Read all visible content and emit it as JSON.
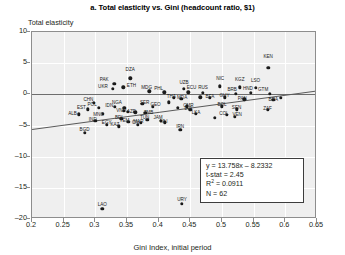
{
  "chart_data": {
    "type": "scatter",
    "title": "a. Total elasticity vs. Gini (headcount ratio, $1)",
    "xlabel": "Gini Index, initial period",
    "ylabel": "Total elasticity",
    "xlim": [
      0.2,
      0.65
    ],
    "ylim": [
      -20,
      10
    ],
    "xticks": [
      "0.2",
      "0.25",
      "0.3",
      "0.35",
      "0.4",
      "0.45",
      "0.5",
      "0.55",
      "0.6",
      "0.65"
    ],
    "xtick_values": [
      0.2,
      0.25,
      0.3,
      0.35,
      0.4,
      0.45,
      0.5,
      0.55,
      0.6,
      0.65
    ],
    "yticks": [
      "10",
      "5",
      "0",
      "–5",
      "–10",
      "–15",
      "–20"
    ],
    "ytick_values": [
      10,
      5,
      0,
      -5,
      -10,
      -15,
      -20
    ],
    "grid": true,
    "legend": "none",
    "zero_reference_line": 0,
    "trendline": {
      "slope": 13.758,
      "intercept": -8.2332,
      "x_start": 0.2,
      "x_end": 0.65
    },
    "points": [
      {
        "label": "KEN",
        "x": 0.573,
        "y": 4.3,
        "lx": 0.573,
        "ly": 6.2
      },
      {
        "label": "DZA",
        "x": 0.355,
        "y": 2.6,
        "lx": 0.355,
        "ly": 4.0
      },
      {
        "label": "PAK",
        "x": 0.33,
        "y": 1.7,
        "lx": 0.314,
        "ly": 2.5
      },
      {
        "label": "ETH",
        "x": 0.344,
        "y": 1.1,
        "lx": 0.357,
        "ly": 1.5
      },
      {
        "label": "UKR",
        "x": 0.328,
        "y": 0.9,
        "lx": 0.312,
        "ly": 1.3
      },
      {
        "label": "LSO",
        "x": 0.553,
        "y": 1.0,
        "lx": 0.553,
        "ly": 2.3
      },
      {
        "label": "KGZ",
        "x": 0.528,
        "y": 1.1,
        "lx": 0.528,
        "ly": 2.4
      },
      {
        "label": "NIC",
        "x": 0.497,
        "y": 1.3,
        "lx": 0.497,
        "ly": 2.6
      },
      {
        "label": "UZB",
        "x": 0.44,
        "y": 0.9,
        "lx": 0.44,
        "ly": 1.9
      },
      {
        "label": "GTM",
        "x": 0.575,
        "y": 0.1,
        "lx": 0.565,
        "ly": 0.9
      },
      {
        "label": "HND",
        "x": 0.545,
        "y": 0.2,
        "lx": 0.541,
        "ly": 1.0
      },
      {
        "label": "BRB",
        "x": 0.522,
        "y": 0.1,
        "lx": 0.516,
        "ly": 0.9
      },
      {
        "label": "RUS",
        "x": 0.47,
        "y": 0.2,
        "lx": 0.47,
        "ly": 1.1
      },
      {
        "label": "ECU",
        "x": 0.447,
        "y": 0.3,
        "lx": 0.452,
        "ly": 1.2
      },
      {
        "label": "PHL",
        "x": 0.409,
        "y": 0.3,
        "lx": 0.4,
        "ly": 1.0
      },
      {
        "label": "MDG",
        "x": 0.385,
        "y": 0.5,
        "lx": 0.381,
        "ly": 1.1
      },
      {
        "label": "NGA",
        "x": 0.346,
        "y": -2.2,
        "lx": 0.334,
        "ly": -1.3
      },
      {
        "label": "CHN",
        "x": 0.298,
        "y": -1.4,
        "lx": 0.289,
        "ly": -0.7
      },
      {
        "label": "POL",
        "x": 0.305,
        "y": -2.2,
        "lx": 0.295,
        "ly": -1.6
      },
      {
        "label": "IDN",
        "x": 0.331,
        "y": -2.0,
        "lx": 0.322,
        "ly": -1.7
      },
      {
        "label": "VNM",
        "x": 0.351,
        "y": -2.8,
        "lx": 0.341,
        "ly": -2.5
      },
      {
        "label": "EST",
        "x": 0.288,
        "y": -2.4,
        "lx": 0.278,
        "ly": -2.1
      },
      {
        "label": "SER",
        "x": 0.374,
        "y": -1.5,
        "lx": 0.378,
        "ly": -1.2
      },
      {
        "label": "GEO",
        "x": 0.391,
        "y": -2.0,
        "lx": 0.395,
        "ly": -1.6
      },
      {
        "label": "AZE",
        "x": 0.363,
        "y": -2.9,
        "lx": 0.357,
        "ly": -2.6
      },
      {
        "label": "ZMB",
        "x": 0.379,
        "y": -3.0,
        "lx": 0.384,
        "ly": -2.9
      },
      {
        "label": "ALB",
        "x": 0.274,
        "y": -3.2,
        "lx": 0.264,
        "ly": -3.0
      },
      {
        "label": "MNG",
        "x": 0.312,
        "y": -3.1,
        "lx": 0.305,
        "ly": -3.1
      },
      {
        "label": "THA",
        "x": 0.424,
        "y": -0.6,
        "lx": 0.42,
        "ly": -0.3
      },
      {
        "label": "MDA",
        "x": 0.436,
        "y": -0.7,
        "lx": 0.437,
        "ly": -0.4
      },
      {
        "label": "BFA",
        "x": 0.481,
        "y": -0.6,
        "lx": 0.481,
        "ly": -0.3
      },
      {
        "label": "GUY",
        "x": 0.504,
        "y": -0.5,
        "lx": 0.504,
        "ly": -0.1
      },
      {
        "label": "PAN",
        "x": 0.535,
        "y": -0.8,
        "lx": 0.532,
        "ly": -0.6
      },
      {
        "label": "BRA",
        "x": 0.581,
        "y": -0.9,
        "lx": 0.581,
        "ly": -0.7
      },
      {
        "label": "CMR",
        "x": 0.444,
        "y": -1.9,
        "lx": 0.447,
        "ly": -1.7
      },
      {
        "label": "BOL",
        "x": 0.5,
        "y": -1.9,
        "lx": 0.5,
        "ly": -1.6
      },
      {
        "label": "SEN",
        "x": 0.523,
        "y": -2.4,
        "lx": 0.523,
        "ly": -2.1
      },
      {
        "label": "ZAF",
        "x": 0.572,
        "y": -2.5,
        "lx": 0.572,
        "ly": -2.2
      },
      {
        "label": "LKA",
        "x": 0.459,
        "y": -3.1,
        "lx": 0.459,
        "ly": -2.8
      },
      {
        "label": "COL",
        "x": 0.508,
        "y": -3.3,
        "lx": 0.503,
        "ly": -3.0
      },
      {
        "label": "VEN",
        "x": 0.52,
        "y": -3.6,
        "lx": 0.524,
        "ly": -3.2
      },
      {
        "label": "LVA",
        "x": 0.45,
        "y": -2.5,
        "lx": 0.447,
        "ly": -2.2
      },
      {
        "label": "JAM",
        "x": 0.403,
        "y": -4.2,
        "lx": 0.399,
        "ly": -3.7
      },
      {
        "label": "TUN",
        "x": 0.382,
        "y": -4.1,
        "lx": 0.378,
        "ly": -3.6
      },
      {
        "label": "YEM",
        "x": 0.352,
        "y": -4.4,
        "lx": 0.346,
        "ly": -4.1
      },
      {
        "label": "MAR",
        "x": 0.372,
        "y": -4.6,
        "lx": 0.368,
        "ly": -4.3
      },
      {
        "label": "MLI",
        "x": 0.41,
        "y": -4.5,
        "lx": 0.408,
        "ly": -4.2
      },
      {
        "label": "BDI",
        "x": 0.341,
        "y": -3.9,
        "lx": 0.337,
        "ly": -3.6
      },
      {
        "label": "IND",
        "x": 0.3,
        "y": -4.2,
        "lx": 0.296,
        "ly": -3.9
      },
      {
        "label": "CIV",
        "x": 0.367,
        "y": -4.9,
        "lx": 0.364,
        "ly": -4.5
      },
      {
        "label": "EGY",
        "x": 0.318,
        "y": -4.9,
        "lx": 0.318,
        "ly": -4.4
      },
      {
        "label": "KAZ",
        "x": 0.337,
        "y": -5.1,
        "lx": 0.331,
        "ly": -4.7
      },
      {
        "label": "BGD",
        "x": 0.283,
        "y": -6.2,
        "lx": 0.283,
        "ly": -5.6
      },
      {
        "label": "IRN",
        "x": 0.434,
        "y": -5.7,
        "lx": 0.434,
        "ly": -5.1
      },
      {
        "label": "LAO",
        "x": 0.311,
        "y": -18.4,
        "lx": 0.311,
        "ly": -17.6
      },
      {
        "label": "URY",
        "x": 0.437,
        "y": -17.6,
        "lx": 0.437,
        "ly": -16.8
      },
      {
        "label": "",
        "x": 0.593,
        "y": -0.6,
        "lx": 0,
        "ly": 0
      },
      {
        "label": "",
        "x": 0.466,
        "y": -0.5,
        "lx": 0,
        "ly": 0
      },
      {
        "label": "",
        "x": 0.416,
        "y": -1.3,
        "lx": 0,
        "ly": 0
      },
      {
        "label": "",
        "x": 0.489,
        "y": -3.8,
        "lx": 0,
        "ly": 0
      },
      {
        "label": "",
        "x": 0.345,
        "y": -2.6,
        "lx": 0,
        "ly": 0
      },
      {
        "label": "",
        "x": 0.43,
        "y": -2.2,
        "lx": 0,
        "ly": 0
      }
    ],
    "stats": {
      "equation": "y = 13.758x – 8.2332",
      "tstat": "t-stat = 2.45",
      "r2_prefix": "R",
      "r2_sup": "2",
      "r2_value": " = 0.0911",
      "n": "N = 62"
    }
  }
}
